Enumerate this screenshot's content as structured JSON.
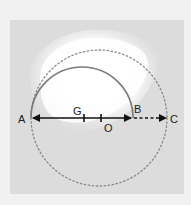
{
  "diagram": {
    "type": "geometry",
    "points": [
      {
        "name": "A",
        "label": "A"
      },
      {
        "name": "G",
        "label": "G"
      },
      {
        "name": "O",
        "label": "O"
      },
      {
        "name": "B",
        "label": "B"
      },
      {
        "name": "C",
        "label": "C"
      }
    ],
    "elements": [
      {
        "kind": "semicircle",
        "over": "AB",
        "style": "solid"
      },
      {
        "kind": "circle",
        "center": "O",
        "through": "A,C",
        "style": "dotted"
      },
      {
        "kind": "double-arrow",
        "from": "A",
        "to": "B",
        "style": "solid"
      },
      {
        "kind": "arrow",
        "from": "B",
        "to": "C",
        "style": "dashed"
      },
      {
        "kind": "tick",
        "at": "G"
      },
      {
        "kind": "tick",
        "at": "O"
      }
    ],
    "colors": {
      "background": "#f1f1f1",
      "panel": "#dcdcdc",
      "highlight": "#ffffff",
      "semicircle": "#7a7a7a",
      "circle": "#8a8a8a",
      "arrow": "#111111"
    }
  }
}
